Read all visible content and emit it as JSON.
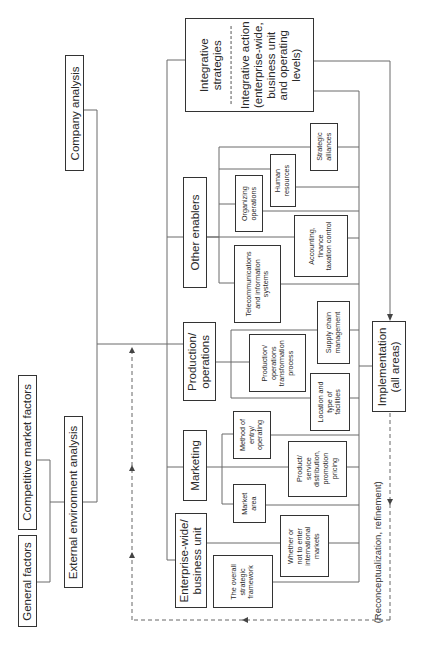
{
  "diagram": {
    "orientation": "rotated 90 degrees counter-clockwise",
    "external": {
      "general_factors": "General factors",
      "competitive_market_factors": "Competitive market factors",
      "external_environment_analysis": "External environment analysis"
    },
    "company_analysis": "Company analysis",
    "integrative": {
      "strategies": "Integrative strategies",
      "action_line1": "Integrative action",
      "action_line2": "(enterprise-wide,",
      "action_line3": "business unit",
      "action_line4": "and operating",
      "action_line5": "levels)"
    },
    "areas": {
      "enterprise": {
        "title_line1": "Enterprise-wide/",
        "title_line2": "business unit",
        "children": [
          {
            "l1": "The overall",
            "l2": "strategic",
            "l3": "framework"
          },
          {
            "l1": "Whether or",
            "l2": "not to enter",
            "l3": "international",
            "l4": "markets"
          }
        ]
      },
      "marketing": {
        "title": "Marketing",
        "children": [
          {
            "l1": "Market",
            "l2": "area"
          },
          {
            "l1": "Method of",
            "l2": "entry/",
            "l3": "operating"
          },
          {
            "l1": "Product/",
            "l2": "service",
            "l3": "distribution,",
            "l4": "promotion",
            "l5": "pricing"
          }
        ]
      },
      "production": {
        "title_line1": "Production/",
        "title_line2": "operations",
        "children": [
          {
            "l1": "Production/",
            "l2": "operations",
            "l3": "transformation",
            "l4": "process"
          },
          {
            "l1": "Location and",
            "l2": "type of",
            "l3": "facilities"
          },
          {
            "l1": "Supply chain",
            "l2": "management"
          }
        ]
      },
      "other": {
        "title": "Other enablers",
        "children": [
          {
            "l1": "Telecommunications",
            "l2": "and information",
            "l3": "systems"
          },
          {
            "l1": "Accounting,",
            "l2": "finance",
            "l3": "taxation control"
          },
          {
            "l1": "Organizing",
            "l2": "operations"
          },
          {
            "l1": "Human",
            "l2": "resources"
          },
          {
            "l1": "Strategic",
            "l2": "alliances"
          }
        ]
      }
    },
    "implementation_line1": "Implementation",
    "implementation_line2": "(all areas)",
    "feedback_label": "(Reconceptualization, refinement)"
  },
  "colors": {
    "line": "#555555",
    "box_border": "#333333",
    "background": "#ffffff"
  }
}
